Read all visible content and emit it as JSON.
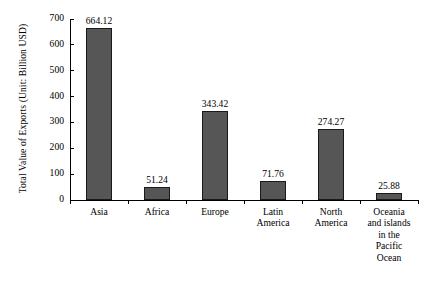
{
  "chart_data": {
    "type": "bar",
    "title": "",
    "subtitle": "",
    "xlabel": "",
    "ylabel": "Total Value of Exports (Unit: Billion USD)",
    "categories": [
      "Asia",
      "Africa",
      "Europe",
      "Latin\nAmerica",
      "North\nAmerica",
      "Oceania\nand islands\nin the\nPacific\nOcean"
    ],
    "values": [
      664.12,
      51.24,
      343.42,
      71.76,
      274.27,
      25.88
    ],
    "value_labels": [
      "664.12",
      "51.24",
      "343.42",
      "71.76",
      "274.27",
      "25.88"
    ],
    "ylim": [
      0,
      700
    ],
    "yticks": [
      0,
      100,
      200,
      300,
      400,
      500,
      600,
      700
    ],
    "ytick_labels": [
      "0",
      "100",
      "200",
      "300",
      "400",
      "500",
      "600",
      "700"
    ],
    "grid": false,
    "legend": false,
    "legend_position": "none",
    "bar_color": "#565656",
    "bar_edge_color": "#1a1a1a",
    "background_color": "#ffffff",
    "axis_color": "#000000"
  }
}
